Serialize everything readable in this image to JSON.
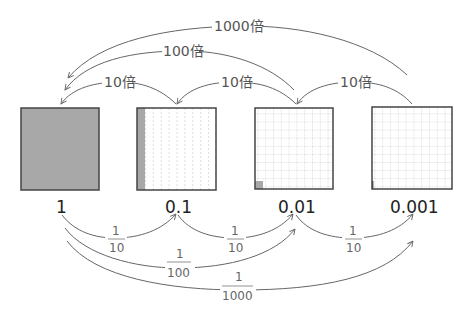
{
  "diagram": {
    "boxes": [
      {
        "value": "1",
        "fill": "full",
        "shade_color": "#a8a8a8"
      },
      {
        "value": "0.1",
        "fill": "one-tenth column",
        "shade_color": "#a8a8a8"
      },
      {
        "value": "0.01",
        "fill": "one hundredth cell",
        "shade_color": "#a8a8a8"
      },
      {
        "value": "0.001",
        "fill": "one thousandth sliver",
        "shade_color": "#a8a8a8"
      }
    ],
    "top_arrows": [
      {
        "label": "10倍",
        "from": "0.1",
        "to": "1"
      },
      {
        "label": "10倍",
        "from": "0.01",
        "to": "0.1"
      },
      {
        "label": "10倍",
        "from": "0.001",
        "to": "0.01"
      },
      {
        "label": "100倍",
        "from": "0.01",
        "to": "1"
      },
      {
        "label": "1000倍",
        "from": "0.001",
        "to": "1"
      }
    ],
    "bottom_arrows": [
      {
        "num": "1",
        "den": "10",
        "from": "1",
        "to": "0.1"
      },
      {
        "num": "1",
        "den": "10",
        "from": "0.1",
        "to": "0.01"
      },
      {
        "num": "1",
        "den": "10",
        "from": "0.01",
        "to": "0.001"
      },
      {
        "num": "1",
        "den": "100",
        "from": "1",
        "to": "0.01"
      },
      {
        "num": "1",
        "den": "1000",
        "from": "1",
        "to": "0.001"
      }
    ]
  }
}
